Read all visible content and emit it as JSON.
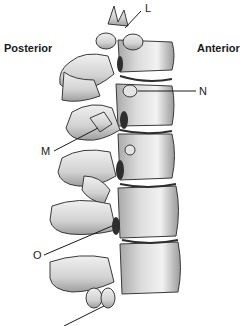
{
  "diagram": {
    "orientation": {
      "left": "Posterior",
      "right": "Anterior"
    },
    "labels": {
      "L": "L",
      "N": "N",
      "M": "M",
      "O": "O",
      "bottom_cut_off": ""
    },
    "colors": {
      "bone_light": "#e8e8e8",
      "bone_mid": "#bdbdbd",
      "bone_dark": "#7a7a7a",
      "outline": "#3a3a3a",
      "gap": "#2e2e2e"
    }
  }
}
